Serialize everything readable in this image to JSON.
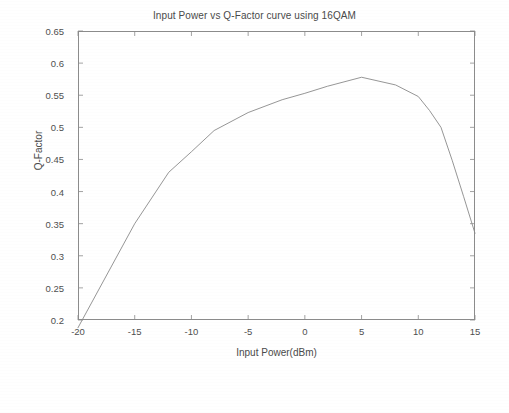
{
  "chart_data": {
    "type": "line",
    "title": "Input Power vs Q-Factor curve using 16QAM",
    "xlabel": "Input Power(dBm)",
    "ylabel": "Q-Factor",
    "xlim": [
      -20,
      15
    ],
    "ylim": [
      0.2,
      0.65
    ],
    "xticks": [
      -20,
      -15,
      -10,
      -5,
      0,
      5,
      10,
      15
    ],
    "xtick_labels": [
      "-20",
      "-15",
      "-10",
      "-5",
      "0",
      "5",
      "10",
      "15"
    ],
    "yticks": [
      0.2,
      0.25,
      0.3,
      0.35,
      0.4,
      0.45,
      0.5,
      0.55,
      0.6,
      0.65
    ],
    "ytick_labels": [
      "0.2",
      "0.25",
      "0.3",
      "0.35",
      "0.4",
      "0.45",
      "0.5",
      "0.55",
      "0.6",
      "0.65"
    ],
    "grid": false,
    "legend": null,
    "legend_position": "none",
    "line_color": "#8a8a8a",
    "line_width": 0.9,
    "series": [
      {
        "name": "Q-Factor vs Input Power (16QAM)",
        "x": [
          -20,
          -15,
          -12,
          -10,
          -8,
          -5,
          -2,
          0,
          2,
          5,
          8,
          10,
          11,
          12,
          13,
          14,
          15
        ],
        "y": [
          0.188,
          0.35,
          0.43,
          0.462,
          0.495,
          0.523,
          0.543,
          0.553,
          0.564,
          0.578,
          0.566,
          0.548,
          0.526,
          0.5,
          0.448,
          0.392,
          0.335
        ]
      }
    ]
  },
  "axes": {
    "frame_color": "#8c8c8c",
    "tick_color": "#8c8c8c",
    "text_color": "#4a4a4a"
  },
  "figure": {
    "background": "#ffffff"
  }
}
